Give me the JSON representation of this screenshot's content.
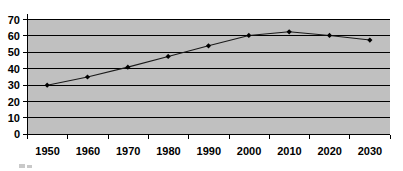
{
  "chart_data": {
    "type": "line",
    "title": "",
    "subtitle": "",
    "xlabel": "",
    "ylabel": "",
    "categories": [
      "1950",
      "1960",
      "1970",
      "1980",
      "1990",
      "2000",
      "2010",
      "2020",
      "2030"
    ],
    "x": [
      1950,
      1960,
      1970,
      1980,
      1990,
      2000,
      2010,
      2020,
      2030
    ],
    "values": [
      30,
      35,
      41,
      47.5,
      54,
      60.3,
      62.5,
      60.3,
      57.5
    ],
    "series": [
      {
        "name": "",
        "values": [
          30,
          35,
          41,
          47.5,
          54,
          60.3,
          62.5,
          60.3,
          57.5
        ]
      }
    ],
    "ylim": [
      0,
      70
    ],
    "ytick_labels": [
      "0",
      "10",
      "20",
      "30",
      "40",
      "50",
      "60",
      "70"
    ],
    "yticks": [
      0,
      10,
      20,
      30,
      40,
      50,
      60,
      70
    ],
    "xtick_labels": [
      "1950",
      "1960",
      "1970",
      "1980",
      "1990",
      "2000",
      "2010",
      "2020",
      "2030"
    ],
    "grid": "horizontal",
    "legend": "none",
    "marker": "diamond",
    "plot_background_color": "#c0c0c0",
    "line_color": "#1a1a1a",
    "marker_color": "#000000",
    "axis_color": "#000000",
    "page_background_color": "#ffffff"
  },
  "axes": {
    "y_labels": [
      "70",
      "60",
      "50",
      "40",
      "30",
      "20",
      "10",
      "0"
    ],
    "x_labels": [
      "1950",
      "1960",
      "1970",
      "1980",
      "1990",
      "2000",
      "2010",
      "2020",
      "2030"
    ]
  }
}
